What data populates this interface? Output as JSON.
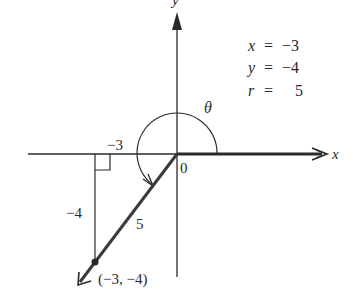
{
  "diagram": {
    "axes": {
      "x_label": "x",
      "y_label": "y",
      "origin_label": "0"
    },
    "angle_label": "θ",
    "legend": [
      {
        "var": "x",
        "eq": "=",
        "value": "−3"
      },
      {
        "var": "y",
        "eq": "=",
        "value": "−4"
      },
      {
        "var": "r",
        "eq": "=",
        "value": "5"
      }
    ],
    "side_labels": {
      "horizontal": "−3",
      "vertical": "−4",
      "hypotenuse": "5"
    },
    "point_label": "(−3, −4)",
    "point": {
      "x": -3,
      "y": -4
    },
    "r": 5,
    "colors": {
      "line": "#2a2a2a",
      "ray": "#3a3a3a",
      "background": "#ffffff"
    }
  }
}
